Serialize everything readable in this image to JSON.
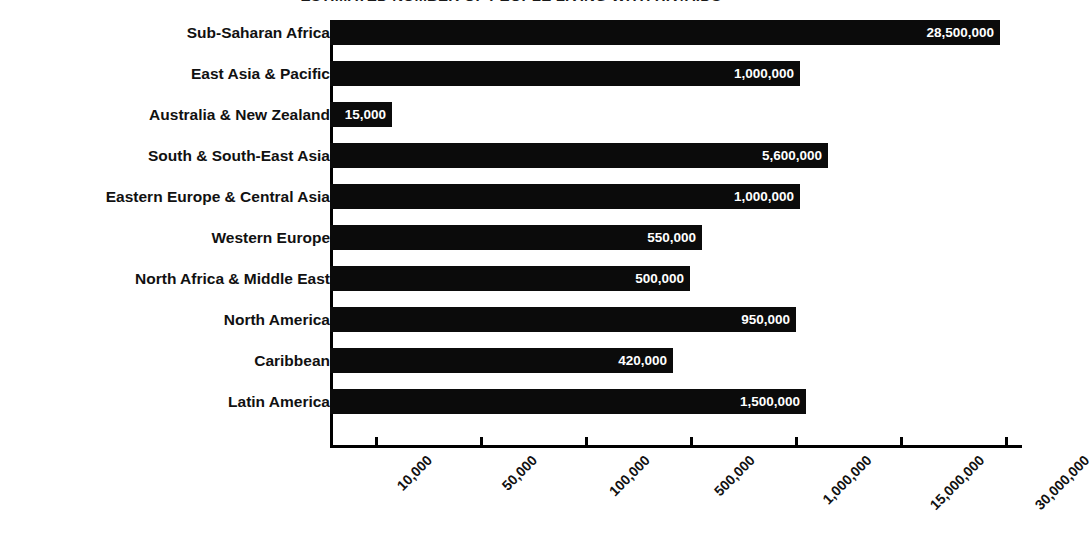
{
  "chart_data": {
    "type": "bar",
    "orientation": "horizontal",
    "title": "ESTIMATED NUMBER OF PEOPLE LIVING WITH HIV/AIDS",
    "xlabel": "",
    "ylabel": "",
    "grid": false,
    "legend": null,
    "axis_scale": "log-like (non-linear, evenly spaced ticks)",
    "categories": [
      "Sub-Saharan Africa",
      "East Asia & Pacific",
      "Australia & New Zealand",
      "South & South-East Asia",
      "Eastern Europe & Central Asia",
      "Western Europe",
      "North Africa & Middle East",
      "North America",
      "Caribbean",
      "Latin America"
    ],
    "values": [
      28500000,
      1000000,
      15000,
      5600000,
      1000000,
      550000,
      500000,
      950000,
      420000,
      1500000
    ],
    "value_labels": [
      "28,500,000",
      "1,000,000",
      "15,000",
      "5,600,000",
      "1,000,000",
      "550,000",
      "500,000",
      "950,000",
      "420,000",
      "1,500,000"
    ],
    "bar_pixel_ends": [
      1000,
      800,
      392,
      828,
      800,
      702,
      690,
      796,
      673,
      806
    ],
    "xticks": [
      10000,
      50000,
      100000,
      500000,
      1000000,
      15000000,
      30000000
    ],
    "xtick_labels": [
      "10,000",
      "50,000",
      "100,000",
      "500,000",
      "1,000,000",
      "15,000,000",
      "30,000,000"
    ],
    "xtick_pixel_positions": [
      375,
      480,
      585,
      690,
      795,
      900,
      1005
    ],
    "colors": {
      "bar": "#0b0b0b",
      "value_text": "#ffffff",
      "axis": "#000000",
      "background": "#ffffff",
      "label_text": "#111111"
    }
  },
  "footer": {
    "faint_text": ""
  }
}
